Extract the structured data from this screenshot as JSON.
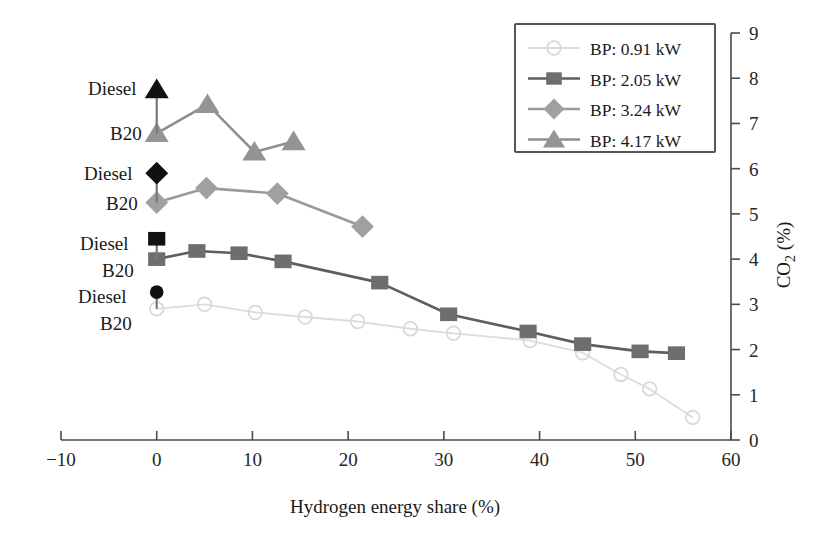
{
  "chart_data": {
    "type": "line",
    "title": "",
    "xlabel": "Hydrogen energy share (%)",
    "ylabel": "CO2 (%)",
    "ylabel_display": "CO",
    "ylabel_sub": "2",
    "ylabel_unit": " (%)",
    "xlim": [
      -10,
      60
    ],
    "ylim": [
      0,
      9
    ],
    "xticks": [
      -10,
      0,
      10,
      20,
      30,
      40,
      50,
      60
    ],
    "xticklabels": [
      "−10",
      "0",
      "10",
      "20",
      "30",
      "40",
      "50",
      "60"
    ],
    "yticks": [
      0,
      1,
      2,
      3,
      4,
      5,
      6,
      7,
      8,
      9
    ],
    "yticklabels": [
      "0",
      "1",
      "2",
      "3",
      "4",
      "5",
      "6",
      "7",
      "8",
      "9"
    ],
    "yaxis_position": "right",
    "grid": false,
    "legend_position": "top-right",
    "series": [
      {
        "name": "BP: 0.91 kW",
        "marker": "circle",
        "color": "#d9d9d9",
        "line_color": "#dcdcdc",
        "x": [
          0.0,
          5.0,
          10.3,
          15.5,
          21.0,
          26.5,
          31.0,
          39.0,
          44.5,
          48.5,
          51.5,
          56.0
        ],
        "y": [
          2.9,
          3.0,
          2.82,
          2.72,
          2.62,
          2.46,
          2.36,
          2.2,
          1.93,
          1.45,
          1.13,
          0.5
        ]
      },
      {
        "name": "BP: 2.05 kW",
        "marker": "square",
        "color": "#6e6e6e",
        "line_color": "#5e5e5e",
        "x": [
          0.0,
          4.2,
          8.6,
          13.2,
          23.3,
          30.5,
          38.8,
          44.5,
          50.5,
          54.3
        ],
        "y": [
          4.0,
          4.18,
          4.13,
          3.95,
          3.48,
          2.78,
          2.4,
          2.12,
          1.96,
          1.92
        ]
      },
      {
        "name": "BP: 3.24 kW",
        "marker": "diamond",
        "color": "#a0a0a0",
        "line_color": "#9a9a9a",
        "x": [
          0.0,
          5.2,
          12.6,
          21.5
        ],
        "y": [
          5.25,
          5.57,
          5.45,
          4.72
        ]
      },
      {
        "name": "BP: 4.17 kW",
        "marker": "triangle",
        "color": "#949494",
        "line_color": "#8e8e8e",
        "x": [
          0.0,
          5.3,
          10.2,
          14.3
        ],
        "y": [
          6.78,
          7.42,
          6.37,
          6.6
        ]
      }
    ],
    "diesel_points": [
      {
        "label": "Diesel",
        "marker": "triangle",
        "color": "#111111",
        "x": 0.0,
        "y": 7.75
      },
      {
        "label": "Diesel",
        "marker": "diamond",
        "color": "#111111",
        "x": 0.0,
        "y": 5.9
      },
      {
        "label": "Diesel",
        "marker": "square",
        "color": "#111111",
        "x": 0.0,
        "y": 4.45
      },
      {
        "label": "Diesel",
        "marker": "circle",
        "color": "#111111",
        "x": 0.0,
        "y": 3.27
      }
    ],
    "b20_labels": [
      {
        "label": "B20",
        "marker": "triangle",
        "x": 0.0,
        "y": 6.78
      },
      {
        "label": "B20",
        "marker": "diamond",
        "x": 0.0,
        "y": 5.25
      },
      {
        "label": "B20",
        "marker": "square",
        "x": 0.0,
        "y": 4.0
      },
      {
        "label": "B20",
        "marker": "circle",
        "x": 0.0,
        "y": 2.9
      }
    ],
    "annotations": [
      {
        "text": "Diesel",
        "x_px": 88,
        "y_px": 95
      },
      {
        "text": "B20",
        "x_px": 110,
        "y_px": 140
      },
      {
        "text": "Diesel",
        "x_px": 84,
        "y_px": 180
      },
      {
        "text": "B20",
        "x_px": 106,
        "y_px": 210
      },
      {
        "text": "Diesel",
        "x_px": 80,
        "y_px": 250
      },
      {
        "text": "B20",
        "x_px": 102,
        "y_px": 277
      },
      {
        "text": "Diesel",
        "x_px": 78,
        "y_px": 303
      },
      {
        "text": "B20",
        "x_px": 100,
        "y_px": 330
      }
    ]
  },
  "legend": {
    "entries": [
      {
        "label": "BP: 0.91 kW"
      },
      {
        "label": "BP: 2.05 kW"
      },
      {
        "label": "BP: 3.24 kW"
      },
      {
        "label": "BP: 4.17 kW"
      }
    ]
  },
  "axes": {
    "x_title": "Hydrogen energy share (%)",
    "y_title_main": "CO",
    "y_title_sub": "2",
    "y_title_unit": " (%)"
  }
}
